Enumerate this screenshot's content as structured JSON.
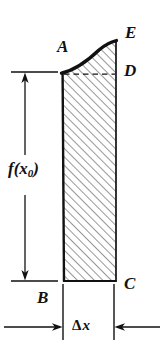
{
  "figure": {
    "type": "math-diagram",
    "background_color": "#ffffff",
    "ink_color": "#111111",
    "labels": {
      "vertex_A": "A",
      "vertex_B": "B",
      "vertex_C": "C",
      "vertex_D": "D",
      "vertex_E": "E",
      "height_function": "f(x",
      "height_subscript": "0",
      "height_close": ")",
      "width_delta": "Δ",
      "width_variable": "x"
    },
    "geometry": {
      "left_edge_x_top": 62,
      "left_edge_x_bottom": 64,
      "right_edge_x": 116,
      "baseline_y": 281,
      "curve_start_y": 73,
      "curve_end_y": 41,
      "dashed_line_y": 74,
      "hatch_angle_deg": 45,
      "hatch_spacing_px": 6
    },
    "dimensions": {
      "vertical_dimension_x": 25,
      "vertical_top_y": 72,
      "vertical_bottom_y": 281,
      "horizontal_dimension_y": 327,
      "horizontal_left_tick_x": 63,
      "horizontal_right_tick_x": 114
    }
  }
}
